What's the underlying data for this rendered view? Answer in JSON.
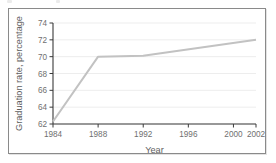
{
  "figure": {
    "frame_border_color": "#8a8a8a",
    "background_color": "#ffffff"
  },
  "chart_data": {
    "type": "line",
    "title": "",
    "subtitle": "",
    "xlabel": "Year",
    "ylabel": "Graduation rate, percentage",
    "xlim": [
      1984,
      2002
    ],
    "ylim": [
      62,
      74
    ],
    "xticks": [
      1984,
      1988,
      1992,
      1996,
      2000,
      2002
    ],
    "xtick_labels": [
      "1984",
      "1988",
      "1992",
      "1996",
      "2000",
      "2002"
    ],
    "yticks": [
      62,
      64,
      66,
      68,
      70,
      72,
      74
    ],
    "ytick_labels": [
      "62",
      "64",
      "66",
      "68",
      "70",
      "72",
      "74"
    ],
    "grid": "horizontal",
    "grid_color": "#ededed",
    "legend": "none",
    "annotations": [],
    "series": [
      {
        "name": "Graduation rate",
        "color": "#c2c2c2",
        "line_width": 2,
        "x": [
          1984,
          1988,
          1992,
          2002
        ],
        "values": [
          62.3,
          70.0,
          70.1,
          72.0
        ]
      }
    ]
  }
}
